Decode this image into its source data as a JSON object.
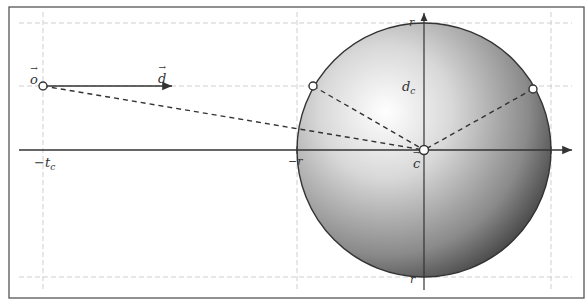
{
  "diagram": {
    "colors": {
      "frame": "#555555",
      "axis": "#333333",
      "grid": "#cfcfcf",
      "sphere_light": "#ffffff",
      "sphere_dark": "#3a3a3a"
    },
    "labels": {
      "origin": "o",
      "direction": "d",
      "center": "c",
      "distance": "d",
      "distance_sub": "c",
      "neg_tc": "−t",
      "neg_tc_sub": "c",
      "radius_top": "r",
      "radius_left": "−r",
      "radius_bottom": "r"
    },
    "elements": {
      "ray_origin": {
        "x": 43,
        "y": 86
      },
      "ray_direction_end": {
        "x": 172,
        "y": 86
      },
      "sphere_center": {
        "x": 424,
        "y": 150
      },
      "sphere_radius": 127,
      "intersection_points": [
        {
          "x": 313,
          "y": 86
        },
        {
          "x": 533,
          "y": 89
        }
      ]
    }
  }
}
